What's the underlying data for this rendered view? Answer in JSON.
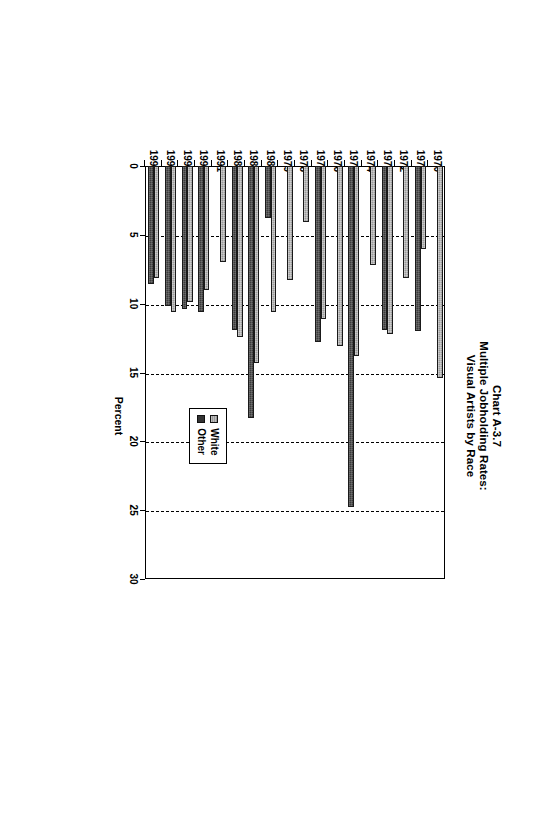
{
  "chart_data": {
    "type": "bar",
    "orientation": "horizontal",
    "title": "Chart A-3.7 Multiple Jobholding Rates: Visual Artists by Race",
    "title_lines": [
      "Chart A-3.7",
      "Multiple Jobholding Rates:",
      "Visual Artists by Race"
    ],
    "xlabel": "Percent",
    "ylabel": "",
    "xlim": [
      0,
      30
    ],
    "xticks": [
      0,
      5,
      10,
      15,
      20,
      25,
      30
    ],
    "xtick_labels": [
      "0",
      "5",
      "10",
      "15",
      "20",
      "25",
      "30"
    ],
    "grid": "vertical-dashed",
    "legend_position": "center-right",
    "categories": [
      "1970",
      "1971",
      "1972",
      "1973",
      "1974",
      "1975",
      "1976",
      "1977",
      "1978",
      "1979",
      "1980",
      "1985",
      "1989",
      "1991",
      "1994",
      "1995",
      "1996",
      "1997"
    ],
    "series": [
      {
        "name": "White",
        "color": "#9a9a9a",
        "values": [
          15.4,
          6.0,
          8.1,
          12.2,
          7.2,
          13.8,
          13.1,
          11.1,
          4.1,
          8.3,
          10.6,
          14.3,
          12.4,
          7.0,
          9.0,
          9.9,
          10.6,
          8.1
        ]
      },
      {
        "name": "Other",
        "color": "#3b3b3b",
        "values": [
          null,
          12.0,
          null,
          11.9,
          null,
          24.8,
          null,
          12.8,
          null,
          null,
          3.8,
          18.3,
          11.9,
          null,
          10.6,
          10.4,
          10.2,
          8.6
        ]
      }
    ]
  },
  "legend": {
    "entries": [
      {
        "label": "White",
        "swatch": "white-hatched-swatch"
      },
      {
        "label": "Other",
        "swatch": "dark-solid-swatch"
      }
    ]
  }
}
